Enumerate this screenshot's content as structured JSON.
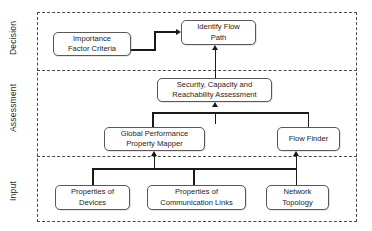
{
  "diagram": {
    "type": "layered-flowchart",
    "colors": {
      "node_border": "#585858",
      "node_fill": "#ffffff",
      "connector": "#1a1a1a",
      "frame_dashed": "#4a4a4a",
      "text": "#1e1e1e"
    }
  },
  "tiers": [
    {
      "key": "decision",
      "label": "Decision"
    },
    {
      "key": "assessment",
      "label": "Assessment"
    },
    {
      "key": "input",
      "label": "Input"
    }
  ],
  "nodes": {
    "importance_factor_criteria": {
      "line1": "Importance",
      "line2": "Factor Criteria",
      "tier": "decision"
    },
    "identify_flow_path": {
      "line1": "Identify Flow",
      "line2": "Path",
      "tier": "decision"
    },
    "security_capacity_reachability": {
      "line1": "Security, Capacity and",
      "line2": "Reachability Assessment",
      "tier": "assessment"
    },
    "global_performance_property_mapper": {
      "line1": "Global Performance",
      "line2": "Property Mapper",
      "tier": "assessment"
    },
    "flow_finder": {
      "line1": "Flow Finder",
      "line2": "",
      "tier": "assessment"
    },
    "properties_of_devices": {
      "line1": "Properties of",
      "line2": "Devices",
      "tier": "input"
    },
    "properties_of_communication_links": {
      "line1": "Properties of",
      "line2": "Communication Links",
      "tier": "input"
    },
    "network_topology": {
      "line1": "Network",
      "line2": "Topology",
      "tier": "input"
    }
  },
  "edges": [
    {
      "from": "importance_factor_criteria",
      "to": "identify_flow_path",
      "style": "elbow-right-up"
    },
    {
      "from": "security_capacity_reachability",
      "to": "identify_flow_path",
      "style": "straight-up"
    },
    {
      "from": "global_performance_property_mapper",
      "to": "security_capacity_reachability",
      "style": "merge-up"
    },
    {
      "from": "flow_finder",
      "to": "security_capacity_reachability",
      "style": "merge-up"
    },
    {
      "from": "properties_of_devices",
      "to": "global_performance_property_mapper",
      "style": "merge-up"
    },
    {
      "from": "properties_of_communication_links",
      "to": "global_performance_property_mapper",
      "style": "merge-up"
    },
    {
      "from": "network_topology",
      "to": "flow_finder",
      "style": "straight-up"
    }
  ]
}
